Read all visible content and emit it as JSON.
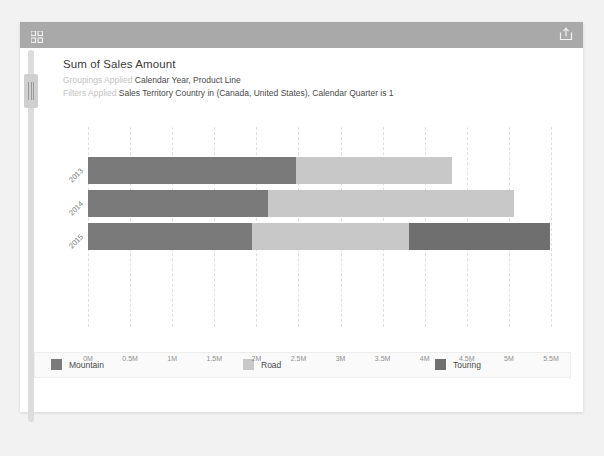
{
  "header": {
    "resize_icon": "resize-grid-icon",
    "export_icon": "export-share-icon"
  },
  "title": "Sum of Sales Amount",
  "meta": {
    "groupings_label": "Groupings Applied",
    "groupings_value": "Calendar Year, Product Line",
    "filters_label": "Filters Applied",
    "filters_value": "Sales Territory Country in (Canada, United States), Calendar Quarter is 1"
  },
  "colors": {
    "mountain": "#7a7a7a",
    "road": "#c8c8c8",
    "touring": "#6f6f6f",
    "header_bar": "#a9a9a9",
    "gridline": "#dfdfdf"
  },
  "chart_data": {
    "type": "bar",
    "orientation": "horizontal",
    "stacked": true,
    "title": "Sum of Sales Amount",
    "xlabel": "",
    "ylabel": "",
    "categories": [
      "2013",
      "2014",
      "2015"
    ],
    "series": [
      {
        "name": "Mountain",
        "color": "#7a7a7a",
        "values": [
          2470000,
          2140000,
          1950000
        ]
      },
      {
        "name": "Road",
        "color": "#c8c8c8",
        "values": [
          1850000,
          2920000,
          1860000
        ]
      },
      {
        "name": "Touring",
        "color": "#6f6f6f",
        "values": [
          0,
          0,
          1680000
        ]
      }
    ],
    "totals": [
      4320000,
      5060000,
      5490000
    ],
    "xlim": [
      0,
      5500000
    ],
    "xticks": [
      0,
      500000,
      1000000,
      1500000,
      2000000,
      2500000,
      3000000,
      3500000,
      4000000,
      4500000,
      5000000,
      5500000
    ],
    "xtick_labels": [
      "0M",
      "0.5M",
      "1M",
      "1.5M",
      "2M",
      "2.5M",
      "3M",
      "3.5M",
      "4M",
      "4.5M",
      "5M",
      "5.5M"
    ],
    "grid": true,
    "legend_position": "bottom"
  },
  "legend": [
    {
      "label": "Mountain",
      "color": "#7a7a7a"
    },
    {
      "label": "Road",
      "color": "#c8c8c8"
    },
    {
      "label": "Touring",
      "color": "#6f6f6f"
    }
  ]
}
